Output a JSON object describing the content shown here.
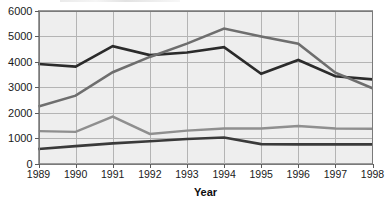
{
  "chart_data": {
    "type": "line",
    "title": "",
    "xlabel": "Year",
    "ylabel": "",
    "categories": [
      "1989",
      "1990",
      "1991",
      "1992",
      "1993",
      "1994",
      "1995",
      "1996",
      "1997",
      "1998"
    ],
    "x": [
      1989,
      1990,
      1991,
      1992,
      1993,
      1994,
      1995,
      1996,
      1997,
      1998
    ],
    "ylim": [
      0,
      6000
    ],
    "xlim": [
      1989,
      1998
    ],
    "yticks": [
      0,
      1000,
      2000,
      3000,
      4000,
      5000,
      6000
    ],
    "ytick_labels": [
      "0",
      "1000",
      "2000",
      "3000",
      "4000",
      "5000",
      "6000"
    ],
    "xtick_labels": [
      "1989",
      "1990",
      "1991",
      "1992",
      "1993",
      "1994",
      "1995",
      "1996",
      "1997",
      "1998"
    ],
    "grid": true,
    "grid_axis": "both",
    "legend": false,
    "legend_position": "none",
    "plot_background": "#eeeeee",
    "series": [
      {
        "name": "series-1",
        "color": "#2b2b2b",
        "width": 2.6,
        "values": [
          3900,
          3800,
          4600,
          4250,
          4350,
          4560,
          3520,
          4060,
          3420,
          3300
        ]
      },
      {
        "name": "series-2",
        "color": "#6e6e6e",
        "width": 2.6,
        "values": [
          2240,
          2660,
          3580,
          4180,
          4700,
          5290,
          4980,
          4700,
          3560,
          2950
        ]
      },
      {
        "name": "series-3",
        "color": "#8f8f8f",
        "width": 2.4,
        "values": [
          1270,
          1240,
          1840,
          1160,
          1290,
          1370,
          1370,
          1470,
          1370,
          1360
        ]
      },
      {
        "name": "series-4",
        "color": "#3a3a3a",
        "width": 2.6,
        "values": [
          570,
          680,
          790,
          870,
          960,
          1020,
          760,
          750,
          750,
          750
        ]
      }
    ]
  },
  "axes": {
    "x_title": "Year"
  }
}
